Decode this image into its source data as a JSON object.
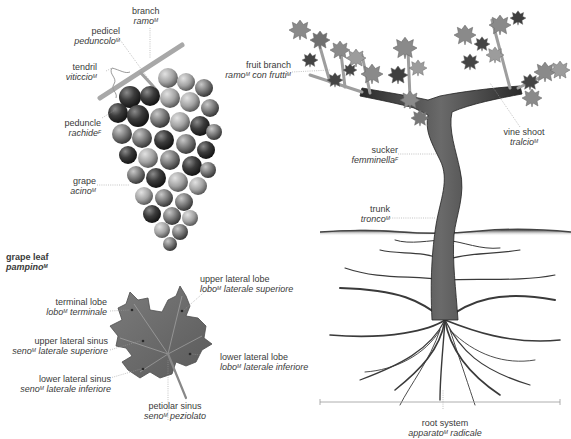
{
  "grape_cluster": {
    "labels": [
      {
        "id": "branch",
        "en": "branch",
        "it": "ramo",
        "gender": "M"
      },
      {
        "id": "pedicel",
        "en": "pedicel",
        "it": "peduncolo",
        "gender": "M"
      },
      {
        "id": "tendril",
        "en": "tendril",
        "it": "viticcio",
        "gender": "M"
      },
      {
        "id": "peduncle",
        "en": "peduncle",
        "it": "rachide",
        "gender": "F"
      },
      {
        "id": "grape",
        "en": "grape",
        "it": "acino",
        "gender": "M"
      }
    ]
  },
  "grape_leaf": {
    "title": {
      "en": "grape leaf",
      "it": "pampino",
      "gender": "M"
    },
    "labels": [
      {
        "id": "terminal-lobe",
        "en": "terminal lobe",
        "it_a": "lobo",
        "gender": "M",
        "it_b": " terminale"
      },
      {
        "id": "upper-lateral-lobe",
        "en": "upper lateral lobe",
        "it_a": "lobo",
        "gender": "M",
        "it_b": " laterale superiore"
      },
      {
        "id": "upper-lateral-sinus",
        "en": "upper lateral sinus",
        "it_a": "seno",
        "gender": "M",
        "it_b": " laterale superiore"
      },
      {
        "id": "lower-lateral-lobe",
        "en": "lower lateral lobe",
        "it_a": "lobo",
        "gender": "M",
        "it_b": " laterale inferiore"
      },
      {
        "id": "lower-lateral-sinus",
        "en": "lower lateral sinus",
        "it_a": "seno",
        "gender": "M",
        "it_b": " laterale inferiore"
      },
      {
        "id": "petiolar-sinus",
        "en": "petiolar sinus",
        "it_a": "seno",
        "gender": "M",
        "it_b": " peziolato"
      }
    ]
  },
  "vine": {
    "labels": [
      {
        "id": "fruit-branch",
        "en": "fruit branch",
        "it_a": "ramo",
        "gender": "M",
        "it_b": " con frutti",
        "gender_b": "M"
      },
      {
        "id": "vine-shoot",
        "en": "vine shoot",
        "it": "tralcio",
        "gender": "M"
      },
      {
        "id": "sucker",
        "en": "sucker",
        "it": "femminella",
        "gender": "F"
      },
      {
        "id": "trunk",
        "en": "trunk",
        "it": "tronco",
        "gender": "M"
      },
      {
        "id": "root-system",
        "en": "root system",
        "it_a": "apparato",
        "gender": "M",
        "it_b": " radicale"
      }
    ]
  },
  "colors": {
    "leaf_light": "#8c8c8c",
    "leaf_dark": "#555555",
    "grape_dark": "#2e2e2e",
    "grape_light": "#9a9a9a",
    "trunk": "#4a4a4a",
    "label_text": "#3a3a3a",
    "leader_line": "#9a9a9a"
  }
}
